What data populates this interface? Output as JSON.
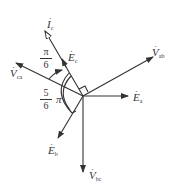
{
  "labels": {
    "Ic": {
      "base": "I",
      "sub": "c"
    },
    "Ec": {
      "base": "E",
      "sub": "c"
    },
    "Vca": {
      "base": "V",
      "sub": "ca"
    },
    "Vab": {
      "base": "V",
      "sub": "ab"
    },
    "Ea": {
      "base": "E",
      "sub": "a"
    },
    "Eb": {
      "base": "E",
      "sub": "b"
    },
    "Vbc": {
      "base": "V",
      "sub": "bc"
    }
  },
  "angles": {
    "pi_over_6": {
      "num": "π",
      "den": "6"
    },
    "five_sixths_pi": {
      "num": "5",
      "den": "6",
      "suffix": "π"
    }
  },
  "dot": "·",
  "colors": {
    "line": "#333333",
    "background": "#ffffff"
  }
}
